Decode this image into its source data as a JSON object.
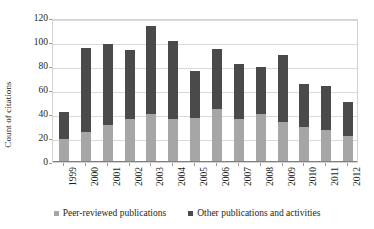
{
  "chart_data": {
    "type": "bar",
    "subtype": "stacked-vertical",
    "title": "",
    "xlabel": "",
    "ylabel": "Count of citations",
    "ylim": [
      0,
      120
    ],
    "ytick_step": 20,
    "ytick_labels": [
      "0",
      "20",
      "40",
      "60",
      "80",
      "100",
      "120"
    ],
    "ytick_values": [
      0,
      20,
      40,
      60,
      80,
      100,
      120
    ],
    "grid": true,
    "legend_position": "bottom",
    "categories": [
      "1999",
      "2000",
      "2001",
      "2002",
      "2003",
      "2004",
      "2005",
      "2006",
      "2007",
      "2008",
      "2009",
      "2010",
      "2011",
      "2012"
    ],
    "series": [
      {
        "name": "Peer-reviewed publications",
        "color": "#a6a6a6",
        "values": [
          19,
          25,
          31,
          36,
          40,
          36,
          37,
          44,
          36,
          40,
          33,
          29,
          27,
          22
        ]
      },
      {
        "name": "Other publications and activities",
        "color": "#4a4a4a",
        "values": [
          23,
          70,
          67,
          57,
          73,
          65,
          39,
          50,
          46,
          39,
          56,
          36,
          36,
          28
        ]
      }
    ],
    "totals": [
      42,
      95,
      98,
      93,
      113,
      101,
      76,
      94,
      82,
      79,
      89,
      65,
      63,
      50
    ]
  },
  "axes": {
    "y_title": "Count of citations"
  },
  "legend": {
    "items": [
      {
        "label": "Peer-reviewed publications",
        "color": "#a6a6a6",
        "marker": "square-marker"
      },
      {
        "label": "Other publications and activities",
        "color": "#4a4a4a",
        "marker": "square-marker"
      }
    ]
  },
  "colors": {
    "peer_reviewed": "#a6a6a6",
    "other": "#4a4a4a",
    "gridline": "#d9d9d9",
    "frame": "#d3d3d3",
    "text": "#231f20",
    "background": "#ffffff"
  }
}
